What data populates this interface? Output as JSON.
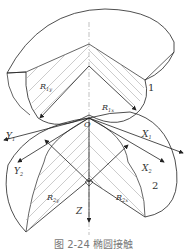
{
  "figure": {
    "caption": "图 2-24  椭圆接触",
    "origin_label": "O",
    "axes": {
      "x1": "X",
      "x1_sub": "1",
      "x2": "X",
      "x2_sub": "2",
      "y1": "Y",
      "y1_sub": "1",
      "y2": "Y",
      "y2_sub": "2",
      "z": "Z"
    },
    "radii": {
      "r1y": "R",
      "r1y_sub": "1y",
      "r1x": "R",
      "r1x_sub": "1x",
      "r2y": "R",
      "r2y_sub": "2y",
      "r2x": "R",
      "r2x_sub": "2x"
    },
    "bodies": {
      "body1": "1",
      "body2": "2"
    }
  }
}
